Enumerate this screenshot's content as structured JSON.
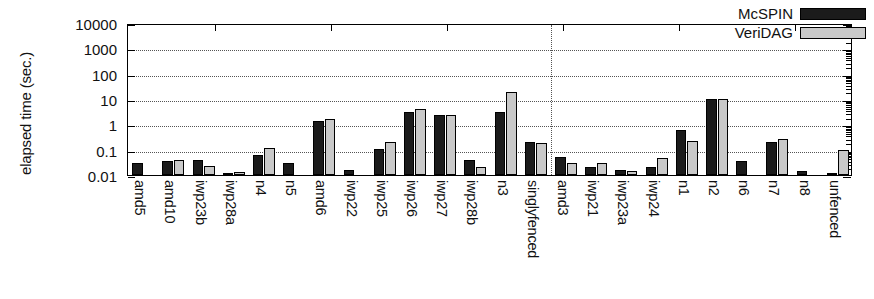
{
  "chart_data": {
    "type": "bar",
    "title": "",
    "xlabel": "",
    "ylabel": "elapsed time (sec.)",
    "yscale": "log",
    "ylim": [
      0.01,
      10000
    ],
    "ytick_labels": [
      "10000",
      "1000",
      "100",
      "10",
      "1",
      "0.1",
      "0.01"
    ],
    "ytick_values": [
      10000,
      1000,
      100,
      10,
      1,
      0.1,
      0.01
    ],
    "grid": true,
    "legend_position": "top-right",
    "divider_after_category": "singlyfenced",
    "categories": [
      "amd5",
      "amd10",
      "iwp23b",
      "iwp28a",
      "n4",
      "n5",
      "amd6",
      "iwp22",
      "iwp25",
      "iwp26",
      "iwp27",
      "iwp28b",
      "n3",
      "singlyfenced",
      "amd3",
      "iwp21",
      "iwp23a",
      "iwp24",
      "n1",
      "n2",
      "n6",
      "n7",
      "n8",
      "unfenced"
    ],
    "series": [
      {
        "name": "McSPIN",
        "color": "#1b1b1b",
        "values": [
          0.03,
          0.037,
          0.04,
          0.012,
          0.06,
          0.03,
          1.3,
          0.016,
          0.11,
          3.1,
          2.4,
          0.04,
          3.0,
          0.2,
          0.05,
          0.02,
          0.016,
          0.02,
          0.6,
          10.0,
          0.035,
          0.2,
          0.014,
          0.012
        ]
      },
      {
        "name": "VeriDAG",
        "color": "#c9c9c9",
        "values": [
          0.01,
          0.04,
          0.023,
          0.013,
          0.12,
          0.0,
          1.6,
          0.0,
          0.2,
          4.0,
          2.4,
          0.02,
          19.0,
          0.18,
          0.03,
          0.03,
          0.014,
          0.046,
          0.23,
          10.0,
          0.0,
          0.26,
          0.0,
          0.095
        ]
      }
    ]
  },
  "legend": {
    "entries": [
      {
        "label": "McSPIN",
        "swatch": "black-swatch"
      },
      {
        "label": "VeriDAG",
        "swatch": "gray-swatch"
      }
    ]
  }
}
